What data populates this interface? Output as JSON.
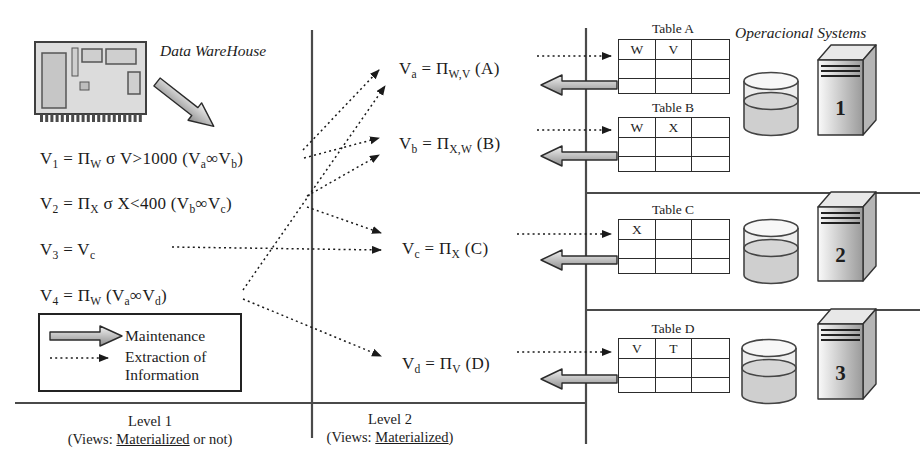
{
  "titles": {
    "data_warehouse": "Data WareHouse",
    "operational_systems": "Operacional Systems"
  },
  "level1": {
    "formulas": [
      "V_{1} = Π_{W} σ V>1000 (V_{a}∞V_{b})",
      "V_{2} = Π_{X} σ X<400 (V_{b}∞V_{c})",
      "V_{3} = V_{c}",
      "V_{4} = Π_{W} (V_{a}∞V_{d})"
    ],
    "footer_label": "Level 1",
    "footer_prefix": "(Views: ",
    "footer_underlined": "Materialized",
    "footer_suffix": " or not)"
  },
  "level2": {
    "formulas": [
      "V_{a} = Π_{W,V} (A)",
      "V_{b} = Π_{X,W} (B)",
      "V_{c} = Π_{X} (C)",
      "V_{d} = Π_{V} (D)"
    ],
    "footer_label": "Level 2",
    "footer_prefix": "(Views: ",
    "footer_underlined": "Materialized",
    "footer_suffix": ")"
  },
  "legend": {
    "maintenance_label": "Maintenance",
    "extraction_label_line1": "Extraction of",
    "extraction_label_line2": "Information"
  },
  "tables": [
    {
      "title": "Table A",
      "headers": [
        "W",
        "V",
        ""
      ]
    },
    {
      "title": "Table B",
      "headers": [
        "W",
        "X",
        ""
      ]
    },
    {
      "title": "Table C",
      "headers": [
        "X",
        "",
        ""
      ]
    },
    {
      "title": "Table D",
      "headers": [
        "V",
        "T",
        ""
      ]
    }
  ],
  "systems": [
    "1",
    "2",
    "3"
  ],
  "icons": {
    "computer": "motherboard-icon",
    "database": "cylinder-database-icon",
    "server": "tower-server-icon",
    "maintenance": "thick-gray-arrow-icon",
    "extraction": "dotted-arrow-icon"
  },
  "colors": {
    "bg": "#ffffff",
    "text": "#1c1c1c",
    "line": "#4a4a4a",
    "dotted": "#1a1a1a",
    "arrow-light": "#f0f0f0",
    "arrow-dark": "#8d8d8d"
  }
}
